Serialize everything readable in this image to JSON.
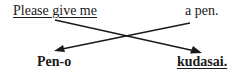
{
  "diagram": {
    "english": {
      "left": "Please give me",
      "right": "a pen."
    },
    "japanese": {
      "left": "Pen-o",
      "right": "kudasai."
    },
    "colors": {
      "text": "#1a1a1a",
      "arrow": "#1a1a1a",
      "background": "#ffffff"
    },
    "arrows": [
      {
        "from": "Please give me",
        "to": "kudasai."
      },
      {
        "from": "a pen.",
        "to": "Pen-o"
      }
    ]
  }
}
